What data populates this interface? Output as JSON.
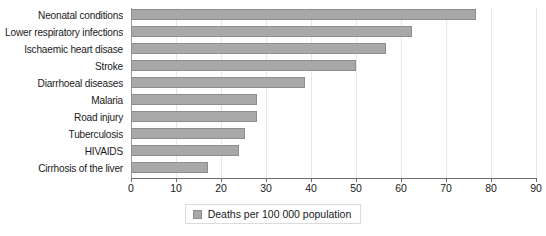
{
  "chart_data": {
    "type": "bar",
    "orientation": "horizontal",
    "title": "",
    "xlabel": "",
    "ylabel": "",
    "xlim": [
      0,
      90
    ],
    "xticks": [
      0,
      10,
      20,
      30,
      40,
      50,
      60,
      70,
      80,
      90
    ],
    "grid": "vertical",
    "legend_position": "bottom-center",
    "categories": [
      "Neonatal conditions",
      "Lower respiratory infections",
      "Ischaemic heart disase",
      "Stroke",
      "Diarrhoeal diseases",
      "Malaria",
      "Road injury",
      "Tuberculosis",
      "HIVAIDS",
      "Cirrhosis of the liver"
    ],
    "series": [
      {
        "name": "Deaths per 100 000 population",
        "color": "#a8a8a8",
        "values": [
          76.7,
          62.5,
          56.7,
          50.0,
          38.7,
          28.0,
          28.0,
          25.3,
          24.0,
          17.0
        ]
      }
    ]
  },
  "legend": {
    "label": "Deaths per 100 000 population",
    "swatch_color": "#a8a8a8"
  },
  "axis": {
    "tick_labels": [
      "0",
      "10",
      "20",
      "30",
      "40",
      "50",
      "60",
      "70",
      "80",
      "90"
    ]
  }
}
